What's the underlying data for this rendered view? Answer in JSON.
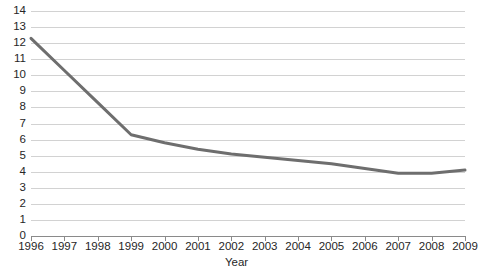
{
  "chart_data": {
    "type": "line",
    "title": "",
    "subtitle": "",
    "xlabel": "Year",
    "ylabel": "",
    "categories": [
      "1996",
      "1997",
      "1998",
      "1999",
      "2000",
      "2001",
      "2002",
      "2003",
      "2004",
      "2005",
      "2006",
      "2007",
      "2008",
      "2009"
    ],
    "x": [
      1996,
      1997,
      1998,
      1999,
      2000,
      2001,
      2002,
      2003,
      2004,
      2005,
      2006,
      2007,
      2008,
      2009
    ],
    "values": [
      12.3,
      10.3,
      8.3,
      6.3,
      5.8,
      5.4,
      5.1,
      4.9,
      4.7,
      4.5,
      4.2,
      3.9,
      3.9,
      4.1
    ],
    "series": [
      {
        "name": "series-1",
        "color": "#6e6e6e",
        "values": [
          12.3,
          10.3,
          8.3,
          6.3,
          5.8,
          5.4,
          5.1,
          4.9,
          4.7,
          4.5,
          4.2,
          3.9,
          3.9,
          4.1
        ]
      }
    ],
    "ylim": [
      0,
      14
    ],
    "xlim": [
      1996,
      2009
    ],
    "ytick_step": 1,
    "yticks": [
      0,
      1,
      2,
      3,
      4,
      5,
      6,
      7,
      8,
      9,
      10,
      11,
      12,
      13,
      14
    ],
    "ytick_labels": [
      "0",
      "1",
      "2",
      "3",
      "4",
      "5",
      "6",
      "7",
      "8",
      "9",
      "10",
      "11",
      "12",
      "13",
      "14"
    ],
    "xtick_labels": [
      "1996",
      "1997",
      "1998",
      "1999",
      "2000",
      "2001",
      "2002",
      "2003",
      "2004",
      "2005",
      "2006",
      "2007",
      "2008",
      "2009"
    ],
    "grid": true,
    "grid_axis": "y",
    "grid_color": "#d2d2d2",
    "axis_color": "#8a8a8a",
    "legend": false,
    "legend_position": "none",
    "background": "#ffffff",
    "markers": false,
    "line_width": 3,
    "annotations": []
  }
}
